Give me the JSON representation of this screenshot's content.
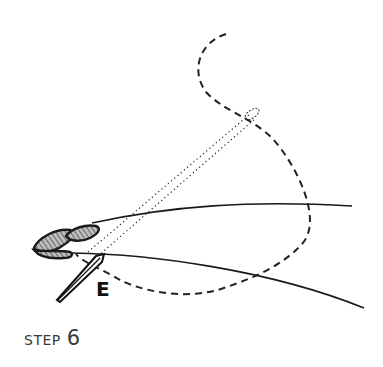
{
  "figure": {
    "point_label": "E",
    "caption": {
      "word": "STEP",
      "number": "6"
    },
    "elements": [
      "solid-thread-upper",
      "solid-thread-lower",
      "dashed-thread-loop",
      "dotted-thread-pair",
      "hatched-bead-knots",
      "needle"
    ],
    "colors": {
      "ink": "#1a1a1a",
      "hatch_fill": "#8a8a8a",
      "caption": "#3a3a3a"
    }
  }
}
